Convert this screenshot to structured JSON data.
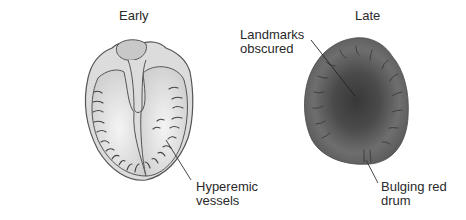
{
  "diagram": {
    "panels": [
      {
        "title": "Early",
        "annotations": [
          {
            "text": "Hyperemic\nvessels"
          }
        ]
      },
      {
        "title": "Late",
        "annotations": [
          {
            "text": "Landmarks\nobscured"
          },
          {
            "text": "Bulging red\ndrum"
          }
        ]
      }
    ],
    "colors": {
      "early_membrane_fill": "#e6e6e6",
      "early_outline": "#555555",
      "vessel_stroke": "#444444",
      "late_outer": "#6b6b6b",
      "late_center": "#3a3a3a",
      "leader_line": "#333333",
      "text": "#2a2a2a"
    }
  }
}
